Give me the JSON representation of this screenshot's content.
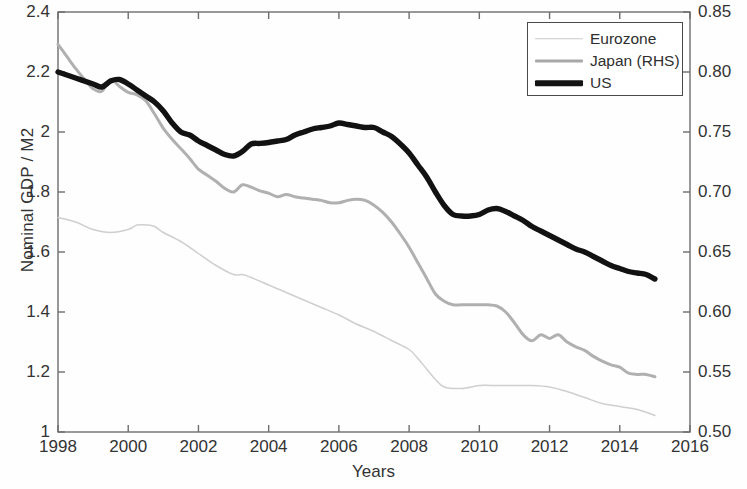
{
  "chart_data": {
    "type": "line",
    "title": "",
    "xlabel": "Years",
    "ylabel": "Nominal GDP / M2",
    "ylabel_right": "",
    "xlim": [
      1998,
      2016
    ],
    "ylim": [
      1.0,
      2.4
    ],
    "ylim_right": [
      0.5,
      0.85
    ],
    "xticks": [
      1998,
      2000,
      2002,
      2004,
      2006,
      2008,
      2010,
      2012,
      2014,
      2016
    ],
    "xtick_labels": [
      "1998",
      "2000",
      "2002",
      "2004",
      "2006",
      "2008",
      "2010",
      "2012",
      "2014",
      "2016"
    ],
    "yticks_left": [
      1,
      1.2,
      1.4,
      1.6,
      1.8,
      2,
      2.2,
      2.4
    ],
    "ytick_labels_left": [
      "1",
      "1.2",
      "1.4",
      "1.6",
      "1.8",
      "2",
      "2.2",
      "2.4"
    ],
    "yticks_right": [
      0.5,
      0.55,
      0.6,
      0.65,
      0.7,
      0.75,
      0.8,
      0.85
    ],
    "ytick_labels_right": [
      "0.50",
      "0.55",
      "0.60",
      "0.65",
      "0.70",
      "0.75",
      "0.80",
      "0.85"
    ],
    "grid": false,
    "legend_position": "top-right",
    "legend": [
      {
        "name": "Eurozone",
        "color": "#cfcfcf",
        "axis": "left",
        "width": 1.5
      },
      {
        "name": "Japan (RHS)",
        "color": "#b0b0b0",
        "axis": "right",
        "width": 3
      },
      {
        "name": "US",
        "color": "#121212",
        "axis": "left",
        "width": 5.4
      }
    ],
    "series": [
      {
        "name": "US",
        "axis": "left",
        "color": "#121212",
        "x": [
          1998.0,
          1998.5,
          1999.0,
          1999.25,
          1999.5,
          1999.75,
          2000.0,
          2000.25,
          2000.5,
          2000.75,
          2001.0,
          2001.25,
          2001.5,
          2001.75,
          2002.0,
          2002.25,
          2002.5,
          2002.75,
          2003.0,
          2003.25,
          2003.5,
          2003.75,
          2004.0,
          2004.25,
          2004.5,
          2004.75,
          2005.0,
          2005.25,
          2005.5,
          2005.75,
          2006.0,
          2006.25,
          2006.5,
          2006.75,
          2007.0,
          2007.25,
          2007.5,
          2007.75,
          2008.0,
          2008.25,
          2008.5,
          2008.75,
          2009.0,
          2009.25,
          2009.5,
          2009.75,
          2010.0,
          2010.25,
          2010.5,
          2010.75,
          2011.0,
          2011.25,
          2011.5,
          2011.75,
          2012.0,
          2012.25,
          2012.5,
          2012.75,
          2013.0,
          2013.25,
          2013.5,
          2013.75,
          2014.0,
          2014.25,
          2014.5,
          2014.75,
          2015.0
        ],
        "y": [
          2.2,
          2.18,
          2.16,
          2.15,
          2.17,
          2.175,
          2.16,
          2.14,
          2.12,
          2.1,
          2.07,
          2.03,
          2.0,
          1.99,
          1.97,
          1.955,
          1.94,
          1.925,
          1.92,
          1.935,
          1.96,
          1.962,
          1.965,
          1.97,
          1.975,
          1.99,
          2.0,
          2.01,
          2.015,
          2.02,
          2.03,
          2.025,
          2.02,
          2.015,
          2.015,
          2.0,
          1.985,
          1.96,
          1.93,
          1.89,
          1.85,
          1.8,
          1.755,
          1.725,
          1.72,
          1.72,
          1.725,
          1.74,
          1.745,
          1.735,
          1.72,
          1.705,
          1.685,
          1.67,
          1.655,
          1.64,
          1.625,
          1.61,
          1.6,
          1.585,
          1.57,
          1.555,
          1.545,
          1.535,
          1.53,
          1.525,
          1.51
        ]
      },
      {
        "name": "Japan (RHS)",
        "axis": "right",
        "color": "#b0b0b0",
        "x": [
          1998.0,
          1998.25,
          1998.5,
          1998.75,
          1999.0,
          1999.25,
          1999.5,
          1999.75,
          2000.0,
          2000.25,
          2000.5,
          2000.75,
          2001.0,
          2001.25,
          2001.5,
          2001.75,
          2002.0,
          2002.25,
          2002.5,
          2002.75,
          2003.0,
          2003.25,
          2003.5,
          2003.75,
          2004.0,
          2004.25,
          2004.5,
          2004.75,
          2005.0,
          2005.25,
          2005.5,
          2005.75,
          2006.0,
          2006.25,
          2006.5,
          2006.75,
          2007.0,
          2007.25,
          2007.5,
          2007.75,
          2008.0,
          2008.25,
          2008.5,
          2008.75,
          2009.0,
          2009.25,
          2009.5,
          2009.75,
          2010.0,
          2010.25,
          2010.5,
          2010.75,
          2011.0,
          2011.25,
          2011.5,
          2011.75,
          2012.0,
          2012.25,
          2012.5,
          2012.75,
          2013.0,
          2013.25,
          2013.5,
          2013.75,
          2014.0,
          2014.25,
          2014.5,
          2014.75,
          2015.0
        ],
        "y_left_equiv": [
          2.29,
          2.25,
          2.21,
          2.175,
          2.145,
          2.135,
          2.175,
          2.15,
          2.13,
          2.125,
          2.105,
          2.06,
          2.01,
          1.975,
          1.945,
          1.91,
          1.875,
          1.855,
          1.835,
          1.81,
          1.8,
          1.825,
          1.815,
          1.805,
          1.795,
          1.785,
          1.79,
          1.785,
          1.78,
          1.775,
          1.77,
          1.765,
          1.765,
          1.77,
          1.775,
          1.77,
          1.755,
          1.73,
          1.7,
          1.66,
          1.615,
          1.565,
          1.51,
          1.46,
          1.435,
          1.425,
          1.425,
          1.425,
          1.425,
          1.425,
          1.42,
          1.4,
          1.365,
          1.325,
          1.305,
          1.325,
          1.31,
          1.325,
          1.3,
          1.285,
          1.27,
          1.25,
          1.235,
          1.225,
          1.215,
          1.195,
          1.19,
          1.19,
          1.185
        ],
        "y": [
          0.823,
          0.813,
          0.803,
          0.794,
          0.786,
          0.784,
          0.794,
          0.788,
          0.783,
          0.781,
          0.776,
          0.765,
          0.753,
          0.744,
          0.736,
          0.728,
          0.719,
          0.714,
          0.709,
          0.703,
          0.7,
          0.706,
          0.704,
          0.701,
          0.699,
          0.696,
          0.698,
          0.696,
          0.695,
          0.694,
          0.693,
          0.691,
          0.691,
          0.693,
          0.694,
          0.693,
          0.689,
          0.683,
          0.675,
          0.665,
          0.654,
          0.641,
          0.628,
          0.615,
          0.609,
          0.606,
          0.606,
          0.606,
          0.606,
          0.606,
          0.605,
          0.6,
          0.591,
          0.581,
          0.576,
          0.581,
          0.578,
          0.581,
          0.575,
          0.571,
          0.568,
          0.563,
          0.559,
          0.556,
          0.554,
          0.549,
          0.548,
          0.548,
          0.546
        ]
      },
      {
        "name": "Eurozone",
        "axis": "left",
        "color": "#cfcfcf",
        "x": [
          1998.0,
          1998.5,
          1999.0,
          1999.5,
          2000.0,
          2000.25,
          2000.5,
          2000.75,
          2001.0,
          2001.5,
          2002.0,
          2002.5,
          2003.0,
          2003.25,
          2003.5,
          2004.0,
          2004.5,
          2005.0,
          2005.5,
          2006.0,
          2006.5,
          2007.0,
          2007.5,
          2008.0,
          2008.25,
          2008.5,
          2008.75,
          2009.0,
          2009.5,
          2010.0,
          2010.5,
          2011.0,
          2011.5,
          2012.0,
          2012.5,
          2013.0,
          2013.5,
          2014.0,
          2014.5,
          2015.0
        ],
        "y": [
          1.715,
          1.7,
          1.675,
          1.665,
          1.675,
          1.69,
          1.69,
          1.685,
          1.665,
          1.635,
          1.595,
          1.555,
          1.525,
          1.525,
          1.515,
          1.49,
          1.465,
          1.44,
          1.415,
          1.39,
          1.36,
          1.335,
          1.305,
          1.275,
          1.245,
          1.21,
          1.175,
          1.15,
          1.145,
          1.155,
          1.155,
          1.155,
          1.155,
          1.15,
          1.135,
          1.115,
          1.095,
          1.085,
          1.075,
          1.055
        ]
      }
    ]
  }
}
